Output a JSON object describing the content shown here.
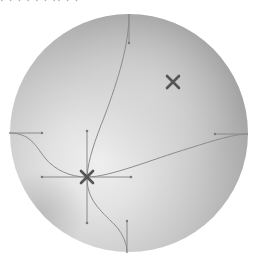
{
  "canvas": {
    "width": 256,
    "height": 267,
    "background": "#ffffff"
  },
  "top_fragment": {
    "text": "·   ·  ·      ·  ·        ·   ··     ·   ·"
  },
  "sphere": {
    "center": [
      129,
      133
    ],
    "radius": 119,
    "edge_color": "#9c9c9c",
    "mid_color": "#c4c4c4",
    "highlight_color": "#ededed"
  },
  "mesh_points": [
    {
      "name": "mesh-point-selected",
      "x": 87,
      "y": 177,
      "color": "#555555"
    },
    {
      "name": "mesh-point-secondary",
      "x": 173,
      "y": 82,
      "color": "#555555"
    }
  ],
  "anchors": {
    "top": [
      129,
      14
    ],
    "bottom": [
      127,
      253
    ],
    "left": [
      9,
      133
    ],
    "right": [
      248,
      134
    ]
  },
  "handle_color": "#8a8a8a",
  "curve_color": "#8c8c8c"
}
